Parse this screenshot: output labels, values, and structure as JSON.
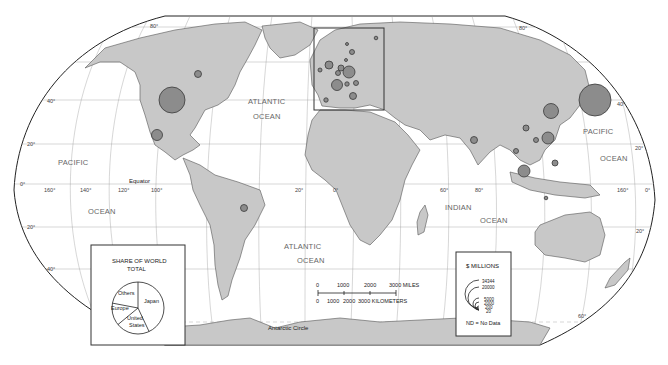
{
  "map": {
    "title": "",
    "oceans": [
      {
        "name": "atlantic-north",
        "line1": "ATLANTIC",
        "line2": "OCEAN"
      },
      {
        "name": "pacific-east",
        "line1": "PACIFIC",
        "line2": ""
      },
      {
        "name": "pacific-west-ocean",
        "line1": "OCEAN",
        "line2": ""
      },
      {
        "name": "pacific-asia",
        "line1": "PACIFIC",
        "line2": "OCEAN"
      },
      {
        "name": "atlantic-south",
        "line1": "ATLANTIC",
        "line2": "OCEAN"
      },
      {
        "name": "indian",
        "line1": "INDIAN",
        "line2": "OCEAN"
      }
    ],
    "reference_lines": {
      "equator": "Equator",
      "antarctic_circle": "Antarctic Circle"
    },
    "latitude_labels": [
      "80°",
      "40°",
      "20°",
      "0°",
      "20°",
      "40°",
      "60°"
    ],
    "longitude_labels": [
      "160°",
      "140°",
      "120°",
      "100°",
      "20°",
      "0°",
      "60°",
      "80°",
      "160°"
    ],
    "right_labels": [
      "80°",
      "40°",
      "20°",
      "0°",
      "20°",
      "60°"
    ]
  },
  "pie_legend": {
    "title_line1": "SHARE OF WORLD",
    "title_line2": "TOTAL",
    "slices": [
      {
        "label": "Japan",
        "share": 0.43
      },
      {
        "label": "United States",
        "share": 0.21
      },
      {
        "label": "Europe",
        "share": 0.14
      },
      {
        "label": "Others",
        "share": 0.22
      }
    ],
    "slice_labels": {
      "japan": "Japan",
      "us_line1": "United",
      "us_line2": "States",
      "europe": "Europe",
      "others": "Others"
    }
  },
  "size_legend": {
    "title": "$ MILLIONS",
    "values": [
      "34344",
      "20000",
      "5000",
      "2000",
      "200",
      "20"
    ],
    "note": "ND = No Data"
  },
  "scale_bar": {
    "miles_ticks": [
      "0",
      "1000",
      "2000",
      "3000 MILES"
    ],
    "km_ticks": [
      "0",
      "1000",
      "2000",
      "3000 KILOMETERS"
    ]
  },
  "bubbles": [
    {
      "region": "Japan",
      "x": 595,
      "y": 100,
      "r": 16
    },
    {
      "region": "United States",
      "x": 172,
      "y": 100,
      "r": 13
    },
    {
      "region": "South Korea",
      "x": 551,
      "y": 111,
      "r": 7.5
    },
    {
      "region": "Taiwan",
      "x": 548,
      "y": 138,
      "r": 6
    },
    {
      "region": "Indonesia",
      "x": 524,
      "y": 171,
      "r": 6
    },
    {
      "region": "Mexico",
      "x": 157,
      "y": 135,
      "r": 5.5
    },
    {
      "region": "Canada",
      "x": 198,
      "y": 74,
      "r": 3.5
    },
    {
      "region": "Brazil",
      "x": 244,
      "y": 208,
      "r": 3.5
    },
    {
      "region": "India",
      "x": 474,
      "y": 140,
      "r": 3.5
    },
    {
      "region": "China",
      "x": 526,
      "y": 128,
      "r": 3
    },
    {
      "region": "Hong Kong",
      "x": 536,
      "y": 140,
      "r": 2.5
    },
    {
      "region": "Thailand",
      "x": 516,
      "y": 151,
      "r": 2.5
    },
    {
      "region": "Philippines",
      "x": 555,
      "y": 163,
      "r": 3
    },
    {
      "region": "Singapore",
      "x": 546,
      "y": 198,
      "r": 1.8
    },
    {
      "region": "Germany",
      "x": 349,
      "y": 72,
      "r": 6
    },
    {
      "region": "France",
      "x": 337,
      "y": 85,
      "r": 5.5
    },
    {
      "region": "United Kingdom",
      "x": 329,
      "y": 65,
      "r": 4
    },
    {
      "region": "Italy",
      "x": 353,
      "y": 96,
      "r": 3.5
    },
    {
      "region": "Netherlands",
      "x": 341,
      "y": 68,
      "r": 3
    },
    {
      "region": "Spain",
      "x": 326,
      "y": 100,
      "r": 2.2
    },
    {
      "region": "Sweden",
      "x": 352,
      "y": 52,
      "r": 2.5
    },
    {
      "region": "Switzerland",
      "x": 347,
      "y": 84,
      "r": 2.2
    },
    {
      "region": "Austria",
      "x": 356,
      "y": 83,
      "r": 2.5
    },
    {
      "region": "Belgium",
      "x": 338,
      "y": 73,
      "r": 2.5
    },
    {
      "region": "Ireland",
      "x": 320,
      "y": 70,
      "r": 2
    },
    {
      "region": "Finland",
      "x": 376,
      "y": 38,
      "r": 1.8
    },
    {
      "region": "Norway",
      "x": 347,
      "y": 44,
      "r": 1.5
    },
    {
      "region": "Denmark",
      "x": 346,
      "y": 60,
      "r": 1.5
    }
  ],
  "colors": {
    "land": "#c8c8c8",
    "bubble": "#8c8c8c",
    "border": "#333333",
    "graticule": "#999999"
  }
}
